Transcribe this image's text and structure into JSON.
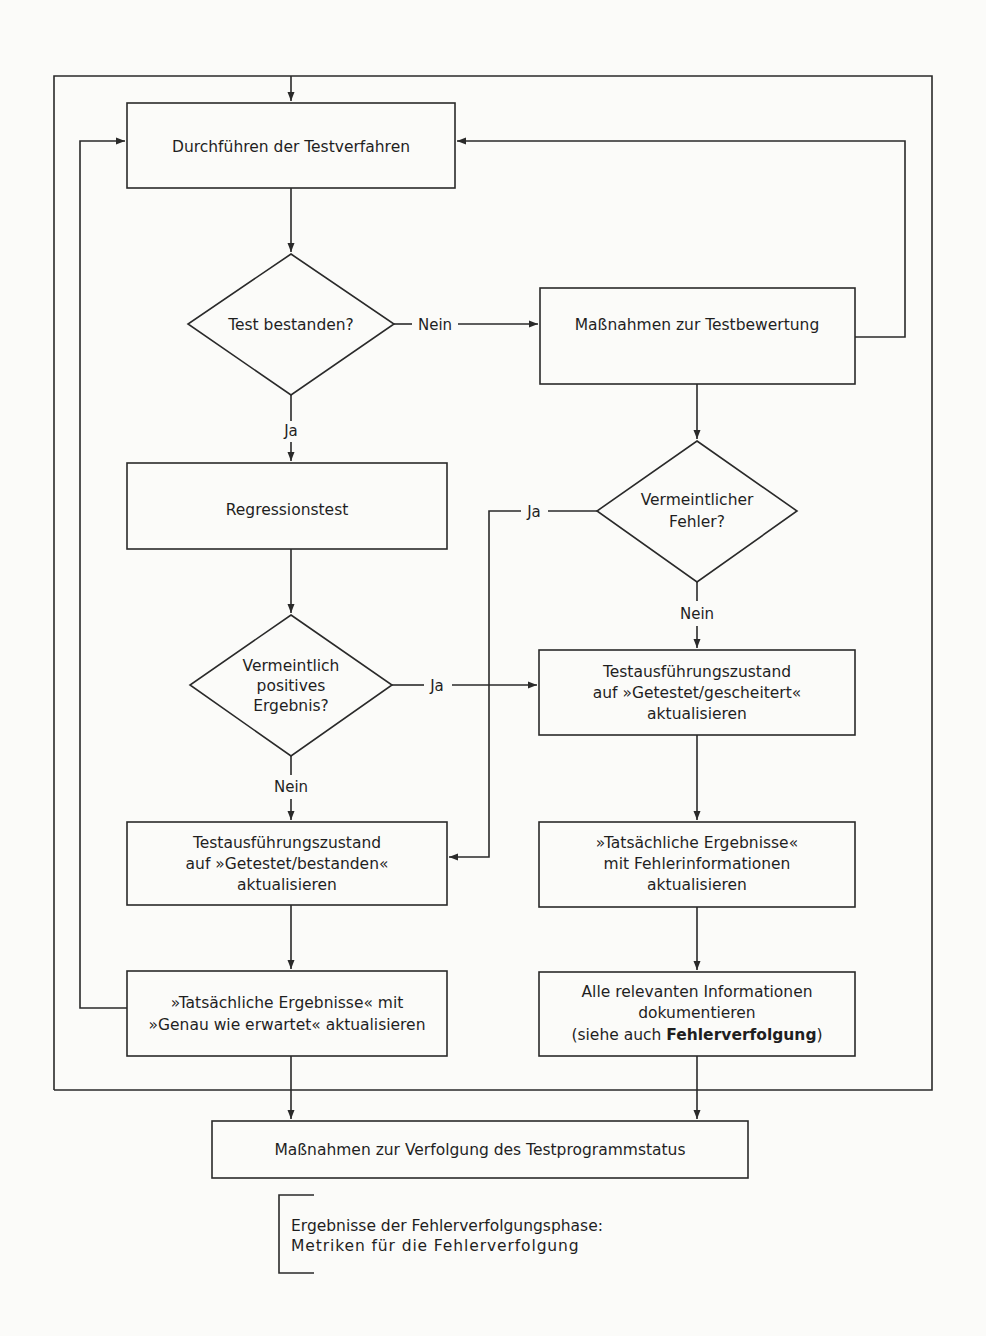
{
  "diagram": {
    "type": "flowchart",
    "language": "de",
    "nodes": {
      "execute_tests": {
        "shape": "process",
        "lines": [
          "Durchführen der Testverfahren"
        ]
      },
      "test_passed": {
        "shape": "decision",
        "lines": [
          "Test bestanden?"
        ]
      },
      "test_evaluation": {
        "shape": "process",
        "lines": [
          "Maßnahmen zur Testbewertung"
        ]
      },
      "regression_test": {
        "shape": "process",
        "lines": [
          "Regressionstest"
        ]
      },
      "suspected_defect": {
        "shape": "decision",
        "lines": [
          "Vermeintlicher",
          "Fehler?"
        ]
      },
      "false_positive": {
        "shape": "decision",
        "lines": [
          "Vermeintlich",
          "positives",
          "Ergebnis?"
        ]
      },
      "status_failed": {
        "shape": "process",
        "lines": [
          "Testausführungszustand",
          "auf »Getestet/gescheitert«",
          "aktualisieren"
        ]
      },
      "status_passed": {
        "shape": "process",
        "lines": [
          "Testausführungszustand",
          "auf »Getestet/bestanden«",
          "aktualisieren"
        ]
      },
      "actual_results_defect": {
        "shape": "process",
        "lines": [
          "»Tatsächliche Ergebnisse«",
          "mit Fehlerinformationen",
          "aktualisieren"
        ]
      },
      "actual_results_expected": {
        "shape": "process",
        "lines": [
          "»Tatsächliche Ergebnisse« mit",
          "»Genau wie erwartet« aktualisieren"
        ]
      },
      "document_info": {
        "shape": "process",
        "lines": [
          "Alle relevanten Informationen",
          "dokumentieren"
        ],
        "last_line_prefix": "(siehe auch ",
        "last_line_bold": "Fehlerverfolgung",
        "last_line_suffix": ")"
      },
      "track_status": {
        "shape": "process",
        "lines": [
          "Maßnahmen zur Verfolgung des Testprogrammstatus"
        ]
      },
      "phase_output": {
        "shape": "annotation",
        "lines": [
          "Ergebnisse der Fehlerverfolgungsphase:",
          "Metriken für die Fehlerverfolgung"
        ]
      }
    },
    "edge_labels": {
      "test_passed_no": "Nein",
      "test_passed_yes": "Ja",
      "suspected_defect_yes": "Ja",
      "suspected_defect_no": "Nein",
      "false_positive_yes": "Ja",
      "false_positive_no": "Nein"
    },
    "edges": [
      {
        "from": "outer_loop",
        "to": "execute_tests"
      },
      {
        "from": "execute_tests",
        "to": "test_passed"
      },
      {
        "from": "test_passed",
        "to": "test_evaluation",
        "label": "Nein"
      },
      {
        "from": "test_passed",
        "to": "regression_test",
        "label": "Ja"
      },
      {
        "from": "test_evaluation",
        "to": "execute_tests"
      },
      {
        "from": "test_evaluation",
        "to": "suspected_defect"
      },
      {
        "from": "suspected_defect",
        "to": "status_passed",
        "label": "Ja"
      },
      {
        "from": "suspected_defect",
        "to": "status_failed",
        "label": "Nein"
      },
      {
        "from": "regression_test",
        "to": "false_positive"
      },
      {
        "from": "false_positive",
        "to": "status_failed",
        "label": "Ja"
      },
      {
        "from": "false_positive",
        "to": "status_passed",
        "label": "Nein"
      },
      {
        "from": "status_passed",
        "to": "actual_results_expected"
      },
      {
        "from": "actual_results_expected",
        "to": "execute_tests"
      },
      {
        "from": "status_failed",
        "to": "actual_results_defect"
      },
      {
        "from": "actual_results_defect",
        "to": "document_info"
      },
      {
        "from": "actual_results_expected",
        "to": "track_status"
      },
      {
        "from": "document_info",
        "to": "track_status"
      }
    ],
    "colors": {
      "line": "#2a2a2a",
      "text": "#1f1f1f",
      "background": "#fbfbf9"
    }
  }
}
